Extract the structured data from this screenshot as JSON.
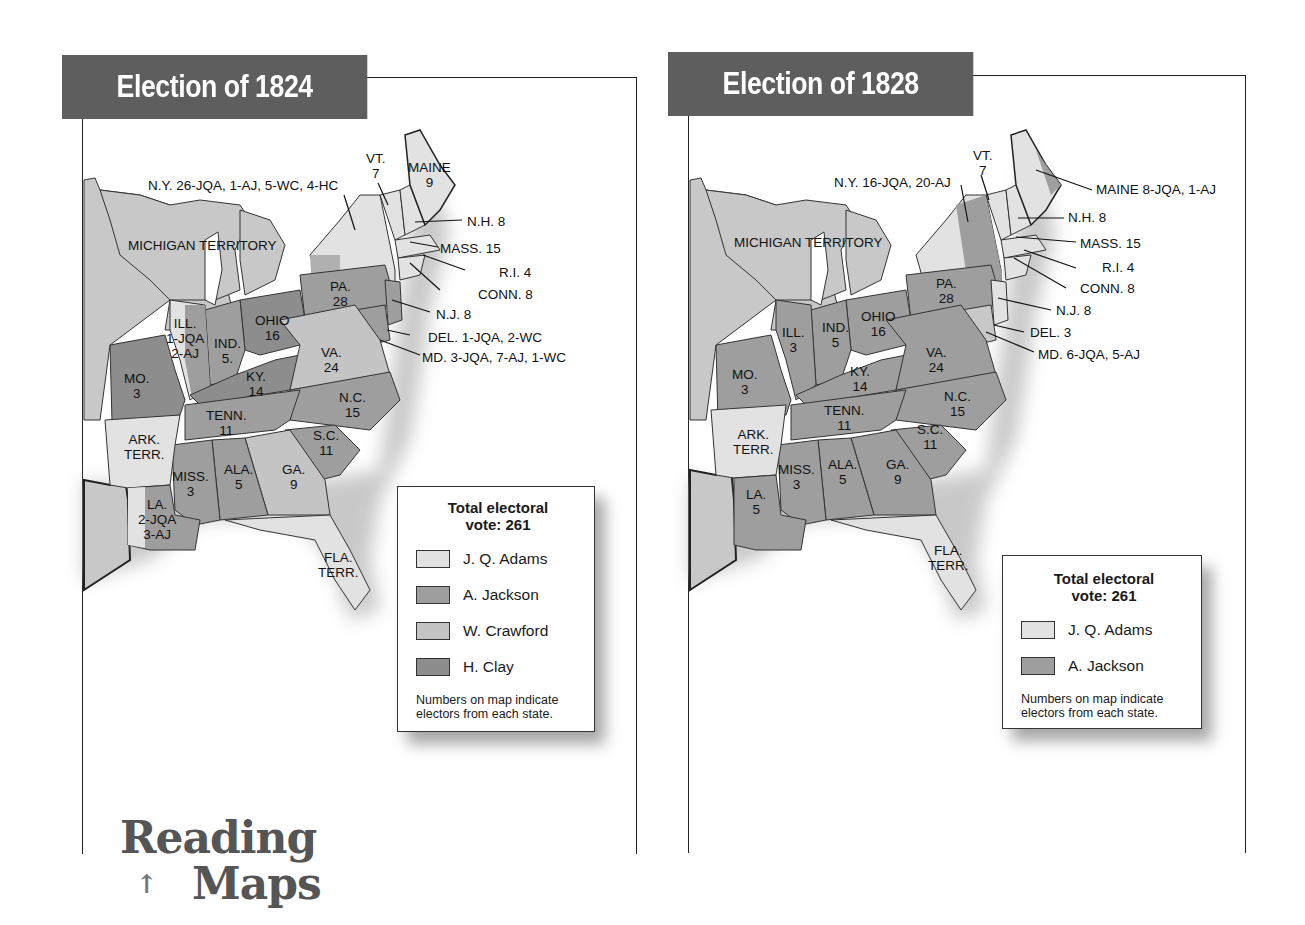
{
  "colors": {
    "adams": "#e2e2e2",
    "jackson": "#9e9e9e",
    "crawford": "#c4c4c4",
    "clay": "#8d8d8d",
    "territory": "#c8c8c8",
    "title_bg": "#5e5e5e",
    "footer_text": "#555555"
  },
  "maps": [
    {
      "title": "Election of 1824",
      "legend": {
        "title_line1": "Total electoral",
        "title_line2": "vote: 261",
        "entries": [
          {
            "label": "J. Q. Adams",
            "color_key": "adams"
          },
          {
            "label": "A. Jackson",
            "color_key": "jackson"
          },
          {
            "label": "W. Crawford",
            "color_key": "crawford"
          },
          {
            "label": "H. Clay",
            "color_key": "clay"
          }
        ],
        "note_line1": "Numbers on map indicate",
        "note_line2": "electors from each state."
      },
      "labels": {
        "ny": "N.Y. 26-JQA, 1-AJ, 5-WC, 4-HC",
        "vt_name": "VT.",
        "vt_num": "7",
        "maine_name": "MAINE",
        "maine_num": "9",
        "nh": "N.H. 8",
        "mass": "MASS. 15",
        "ri": "R.I. 4",
        "conn": "CONN. 8",
        "nj": "N.J. 8",
        "del": "DEL. 1-JQA, 2-WC",
        "md": "MD. 3-JQA, 7-AJ, 1-WC",
        "michigan": "MICHIGAN TERRITORY",
        "pa_name": "PA.",
        "pa_num": "28",
        "ohio_name": "OHIO",
        "ohio_num": "16",
        "ill_name": "ILL.",
        "ill_num1": "1-JQA",
        "ill_num2": "2-AJ",
        "ind_name": "IND.",
        "ind_num": "5.",
        "mo_name": "MO.",
        "mo_num": "3",
        "ky_name": "KY.",
        "ky_num": "14",
        "va_name": "VA.",
        "va_num": "24",
        "nc_name": "N.C.",
        "nc_num": "15",
        "tenn_name": "TENN.",
        "tenn_num": "11",
        "sc_name": "S.C.",
        "sc_num": "11",
        "ark_name": "ARK.",
        "ark_num": "TERR.",
        "miss_name": "MISS.",
        "miss_num": "3",
        "ala_name": "ALA.",
        "ala_num": "5",
        "ga_name": "GA.",
        "ga_num": "9",
        "la_name": "LA.",
        "la_num1": "2-JQA",
        "la_num2": "3-AJ",
        "fla_name": "FLA.",
        "fla_num": "TERR."
      }
    },
    {
      "title": "Election of 1828",
      "legend": {
        "title_line1": "Total electoral",
        "title_line2": "vote: 261",
        "entries": [
          {
            "label": "J. Q. Adams",
            "color_key": "adams"
          },
          {
            "label": "A. Jackson",
            "color_key": "jackson"
          }
        ],
        "note_line1": "Numbers on map indicate",
        "note_line2": "electors from each state."
      },
      "labels": {
        "ny": "N.Y. 16-JQA, 20-AJ",
        "vt_name": "VT.",
        "vt_num": "7",
        "maine": "MAINE 8-JQA, 1-AJ",
        "nh": "N.H. 8",
        "mass": "MASS. 15",
        "ri": "R.I. 4",
        "conn": "CONN.  8",
        "nj": "N.J. 8",
        "del": "DEL. 3",
        "md": "MD. 6-JQA, 5-AJ",
        "michigan": "MICHIGAN TERRITORY",
        "pa_name": "PA.",
        "pa_num": "28",
        "ohio_name": "OHIO",
        "ohio_num": "16",
        "ill_name": "ILL.",
        "ill_num": "3",
        "ind_name": "IND.",
        "ind_num": "5",
        "mo_name": "MO.",
        "mo_num": "3",
        "ky_name": "KY.",
        "ky_num": "14",
        "va_name": "VA.",
        "va_num": "24",
        "nc_name": "N.C.",
        "nc_num": "15",
        "tenn_name": "TENN.",
        "tenn_num": "11",
        "sc_name": "S.C.",
        "sc_num": "11",
        "ark_name": "ARK.",
        "ark_num": "TERR.",
        "miss_name": "MISS.",
        "miss_num": "3",
        "ala_name": "ALA.",
        "ala_num": "5",
        "ga_name": "GA.",
        "ga_num": "9",
        "la_name": "LA.",
        "la_num": "5",
        "fla_name": "FLA.",
        "fla_num": "TERR."
      }
    }
  ],
  "footer": {
    "line1": "Reading",
    "line2": "Maps",
    "arrow_icon": "up-arrow-icon"
  }
}
